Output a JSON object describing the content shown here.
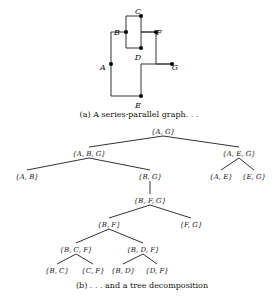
{
  "graph": {
    "caption": "(a) A series-parallel graph. . .",
    "vertices": [
      {
        "id": "A",
        "x": 111,
        "y": 64,
        "lx": 103,
        "ly": 67
      },
      {
        "id": "B",
        "x": 126,
        "y": 32,
        "lx": 117,
        "ly": 32
      },
      {
        "id": "C",
        "x": 141,
        "y": 16,
        "lx": 138,
        "ly": 11
      },
      {
        "id": "D",
        "x": 141,
        "y": 48,
        "lx": 138,
        "ly": 57
      },
      {
        "id": "E",
        "x": 141,
        "y": 96,
        "lx": 138,
        "ly": 105
      },
      {
        "id": "F",
        "x": 156,
        "y": 32,
        "lx": 159,
        "ly": 32
      },
      {
        "id": "G",
        "x": 172,
        "y": 64,
        "lx": 175,
        "ly": 67
      }
    ],
    "edges": [
      [
        "B",
        "C"
      ],
      [
        "C",
        "F"
      ],
      [
        "B",
        "D"
      ],
      [
        "D",
        "F"
      ],
      [
        "B",
        "A"
      ],
      [
        "A",
        "E"
      ],
      [
        "E",
        "G"
      ],
      [
        "G",
        "F"
      ]
    ]
  },
  "tree": {
    "caption": "(b) . . . and a tree decomposition",
    "nodes": [
      {
        "id": "AG",
        "label": "{A, G}",
        "x": 163,
        "y": 131
      },
      {
        "id": "ABG",
        "label": "{A, B, G}",
        "x": 89,
        "y": 153
      },
      {
        "id": "AEG",
        "label": "{A, E, G}",
        "x": 239,
        "y": 153
      },
      {
        "id": "AB",
        "label": "{A, B}",
        "x": 27,
        "y": 176
      },
      {
        "id": "BG",
        "label": "{B, G}",
        "x": 150,
        "y": 176
      },
      {
        "id": "AE",
        "label": "{A, E}",
        "x": 221,
        "y": 176
      },
      {
        "id": "EG",
        "label": "{E, G}",
        "x": 254,
        "y": 176
      },
      {
        "id": "BFG",
        "label": "{B, F, G}",
        "x": 150,
        "y": 200
      },
      {
        "id": "BF",
        "label": "{B, F}",
        "x": 109,
        "y": 224
      },
      {
        "id": "FG",
        "label": "{F, G}",
        "x": 191,
        "y": 224
      },
      {
        "id": "BCF",
        "label": "{B, C, F}",
        "x": 76,
        "y": 249
      },
      {
        "id": "BDF",
        "label": "{B, D, F}",
        "x": 143,
        "y": 249
      },
      {
        "id": "BC",
        "label": "{B, C}",
        "x": 57,
        "y": 270
      },
      {
        "id": "CF",
        "label": "{C, F}",
        "x": 93,
        "y": 270
      },
      {
        "id": "BD",
        "label": "{B, D}",
        "x": 123,
        "y": 270
      },
      {
        "id": "DF",
        "label": "{D, F}",
        "x": 157,
        "y": 270
      }
    ],
    "edges": [
      [
        "AG",
        "ABG"
      ],
      [
        "AG",
        "AEG"
      ],
      [
        "ABG",
        "AB"
      ],
      [
        "ABG",
        "BG"
      ],
      [
        "AEG",
        "AE"
      ],
      [
        "AEG",
        "EG"
      ],
      [
        "BG",
        "BFG"
      ],
      [
        "BFG",
        "BF"
      ],
      [
        "BFG",
        "FG"
      ],
      [
        "BF",
        "BCF"
      ],
      [
        "BF",
        "BDF"
      ],
      [
        "BCF",
        "BC"
      ],
      [
        "BCF",
        "CF"
      ],
      [
        "BDF",
        "BD"
      ],
      [
        "BDF",
        "DF"
      ]
    ]
  }
}
